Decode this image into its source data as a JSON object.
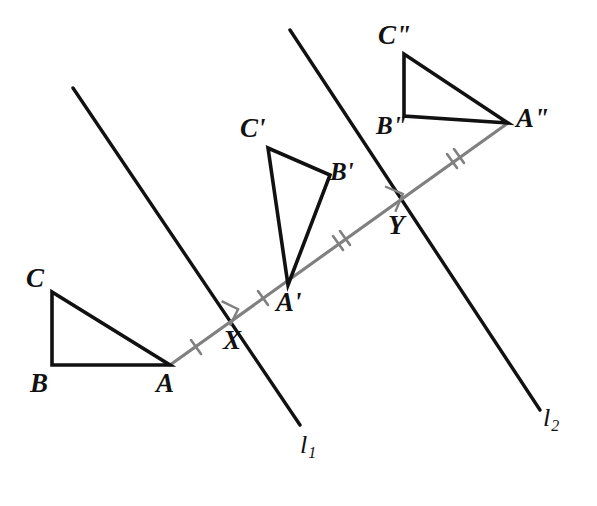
{
  "figure": {
    "colors": {
      "stroke_dark": "#111111",
      "stroke_gray": "#808080",
      "background": "#ffffff"
    },
    "triangles": [
      {
        "name": "original-triangle",
        "vertices": [
          {
            "id": "A",
            "label": "A",
            "x": 170,
            "y": 365,
            "label_x": 156,
            "label_y": 370
          },
          {
            "id": "B",
            "label": "B",
            "x": 52,
            "y": 365,
            "label_x": 30,
            "label_y": 370
          },
          {
            "id": "C",
            "label": "C",
            "x": 52,
            "y": 292,
            "label_x": 26,
            "label_y": 265
          }
        ]
      },
      {
        "name": "first-image-triangle",
        "vertices": [
          {
            "id": "A'",
            "label": "A'",
            "x": 288,
            "y": 285,
            "label_x": 276,
            "label_y": 289
          },
          {
            "id": "B'",
            "label": "B'",
            "x": 330,
            "y": 175,
            "label_x": 330,
            "label_y": 159
          },
          {
            "id": "C'",
            "label": "C'",
            "x": 268,
            "y": 148,
            "label_x": 240,
            "label_y": 115
          }
        ]
      },
      {
        "name": "second-image-triangle",
        "vertices": [
          {
            "id": "A\"",
            "label": "A\"",
            "x": 508,
            "y": 123,
            "label_x": 516,
            "label_y": 105
          },
          {
            "id": "B\"",
            "label": "B\"",
            "x": 404,
            "y": 116,
            "label_x": 376,
            "label_y": 113
          },
          {
            "id": "C\"",
            "label": "C\"",
            "x": 404,
            "y": 54,
            "label_x": 378,
            "label_y": 22
          }
        ]
      }
    ],
    "mirror_lines": [
      {
        "id": "l1",
        "label": "l",
        "subscript": "1",
        "x1": 73,
        "y1": 88,
        "x2": 300,
        "y2": 425,
        "label_x": 300,
        "label_y": 432
      },
      {
        "id": "l2",
        "label": "l",
        "subscript": "2",
        "x1": 290,
        "y1": 30,
        "x2": 540,
        "y2": 410,
        "label_x": 543,
        "label_y": 405
      }
    ],
    "transversal": {
      "id": "transversal-ray",
      "x1": 170,
      "y1": 365,
      "x2": 508,
      "y2": 123,
      "color": "#808080"
    },
    "intersections": [
      {
        "id": "X",
        "label": "X",
        "x": 231,
        "y": 321,
        "label_x": 223,
        "label_y": 327,
        "tick_count": 1
      },
      {
        "id": "Y",
        "label": "Y",
        "x": 396,
        "y": 205,
        "label_x": 388,
        "label_y": 212,
        "tick_count": 2
      }
    ],
    "tick_marks": [
      {
        "name": "tick-A-to-X",
        "cx": 196,
        "cy": 347,
        "count": 1
      },
      {
        "name": "tick-X-to-A-prime",
        "cx": 263,
        "cy": 298,
        "count": 1
      },
      {
        "name": "tick-A-prime-to-Y",
        "cx": 341,
        "cy": 243,
        "count": 2
      },
      {
        "name": "tick-Y-to-A-double-prime",
        "cx": 455,
        "cy": 161,
        "count": 2
      }
    ],
    "right_angle_marks": [
      {
        "name": "right-angle-at-X",
        "x": 231,
        "y": 321
      },
      {
        "name": "right-angle-at-Y",
        "x": 396,
        "y": 205
      }
    ]
  }
}
